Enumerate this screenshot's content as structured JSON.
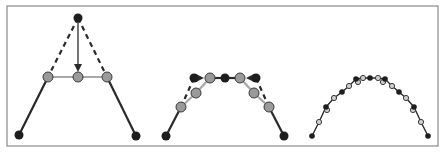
{
  "figure": {
    "width": 444,
    "height": 154,
    "frame": {
      "x": 7,
      "y": 6,
      "w": 431,
      "h": 140,
      "stroke": "#8a8a8a"
    },
    "colors": {
      "control_point": "#1e1e1e",
      "new_point": "#9a9a9a",
      "new_point_stroke": "#3a3a3a",
      "solid_line": "#2a2a2a",
      "refined_line": "#a8a8a8",
      "dashed_line": "#2a2a2a",
      "arrow": "#2a2a2a",
      "hollow_fill": "#cfcfcf"
    }
  },
  "panels": [
    {
      "name": "step-1-initial",
      "solid_lines": [
        [
          [
            19,
            135
          ],
          [
            48,
            77
          ]
        ],
        [
          [
            107,
            77
          ],
          [
            136,
            136
          ]
        ]
      ],
      "refined_lines": [
        [
          [
            48,
            77
          ],
          [
            107,
            77
          ]
        ]
      ],
      "dashed_lines": [
        [
          [
            78,
            18
          ],
          [
            48,
            77
          ]
        ],
        [
          [
            78,
            18
          ],
          [
            107,
            77
          ]
        ]
      ],
      "arrows": [
        {
          "from": [
            78,
            20
          ],
          "to": [
            78,
            70
          ]
        }
      ],
      "control_points": [
        [
          19,
          135
        ],
        [
          78,
          18
        ],
        [
          136,
          136
        ]
      ],
      "new_points": [
        [
          48,
          77
        ],
        [
          78,
          77
        ],
        [
          107,
          77
        ]
      ],
      "r_control": 4.5,
      "r_new": 5
    },
    {
      "name": "step-2-refine",
      "solid_lines": [
        [
          [
            166,
            136
          ],
          [
            181,
            107
          ]
        ],
        [
          [
            269,
            107
          ],
          [
            284,
            136
          ]
        ],
        [
          [
            210,
            78
          ],
          [
            240,
            78
          ]
        ]
      ],
      "refined_lines": [
        [
          [
            181,
            107
          ],
          [
            196,
            93
          ]
        ],
        [
          [
            196,
            93
          ],
          [
            210,
            78
          ]
        ],
        [
          [
            240,
            78
          ],
          [
            254,
            93
          ]
        ],
        [
          [
            254,
            93
          ],
          [
            269,
            107
          ]
        ]
      ],
      "dashed_lines": [
        [
          [
            194,
            78
          ],
          [
            181,
            107
          ]
        ],
        [
          [
            256,
            78
          ],
          [
            269,
            107
          ]
        ]
      ],
      "arrows": [
        {
          "from": [
            194,
            78
          ],
          "to": [
            202,
            78
          ]
        },
        {
          "from": [
            256,
            78
          ],
          "to": [
            248,
            78
          ]
        }
      ],
      "control_points": [
        [
          166,
          136
        ],
        [
          194,
          78
        ],
        [
          225,
          78
        ],
        [
          256,
          78
        ],
        [
          284,
          136
        ]
      ],
      "new_points": [
        [
          181,
          107
        ],
        [
          196,
          93
        ],
        [
          210,
          78
        ],
        [
          240,
          78
        ],
        [
          254,
          93
        ],
        [
          269,
          107
        ]
      ],
      "r_control": 4.5,
      "r_new": 5
    },
    {
      "name": "step-3-converged",
      "solid_lines": [
        [
          [
            312,
            136
          ],
          [
            319,
            122
          ],
          [
            326,
            107
          ],
          [
            334,
            98
          ],
          [
            342,
            92
          ],
          [
            349,
            86
          ],
          [
            356,
            79
          ],
          [
            363,
            78
          ],
          [
            370,
            78
          ],
          [
            378,
            78
          ],
          [
            385,
            79
          ],
          [
            392,
            86
          ],
          [
            399,
            92
          ],
          [
            406,
            98
          ],
          [
            414,
            107
          ],
          [
            421,
            122
          ],
          [
            428,
            136
          ]
        ]
      ],
      "refined_lines": [],
      "dashed_lines": [],
      "arrows": [],
      "control_points": [
        [
          312,
          136
        ],
        [
          326,
          107
        ],
        [
          342,
          92
        ],
        [
          356,
          79
        ],
        [
          370,
          78
        ],
        [
          385,
          79
        ],
        [
          399,
          92
        ],
        [
          414,
          107
        ],
        [
          428,
          136
        ]
      ],
      "hollow_points": [
        [
          319,
          122
        ],
        [
          327,
          110
        ],
        [
          334,
          98
        ],
        [
          349,
          86
        ],
        [
          358,
          82
        ],
        [
          363,
          78
        ],
        [
          378,
          78
        ],
        [
          383,
          82
        ],
        [
          392,
          86
        ],
        [
          406,
          98
        ],
        [
          413,
          110
        ],
        [
          421,
          122
        ]
      ],
      "r_control": 2.8,
      "r_new": 2.6
    }
  ]
}
